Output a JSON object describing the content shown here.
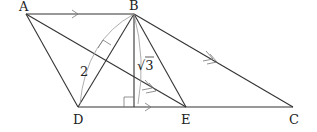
{
  "diagram": {
    "type": "geometry-figure",
    "points": {
      "A": {
        "label": "A",
        "x": 26,
        "y": 14
      },
      "B": {
        "label": "B",
        "x": 134,
        "y": 14
      },
      "C": {
        "label": "C",
        "x": 293,
        "y": 107
      },
      "D": {
        "label": "D",
        "x": 78,
        "y": 107
      },
      "E": {
        "label": "E",
        "x": 186,
        "y": 107
      },
      "H": {
        "label": "",
        "x": 134,
        "y": 107
      }
    },
    "segments": [
      "AB",
      "AD",
      "BD",
      "BE",
      "BH",
      "BC",
      "DC",
      "AE"
    ],
    "measure_labels": {
      "BD": "2",
      "BH": "√3"
    },
    "parallel_marks": {
      "single": [
        "AB",
        "DE"
      ],
      "double": [
        "AE",
        "BC"
      ]
    },
    "right_angles": [
      "BH ⊥ DC at H",
      "AE ⊥ BD"
    ]
  }
}
